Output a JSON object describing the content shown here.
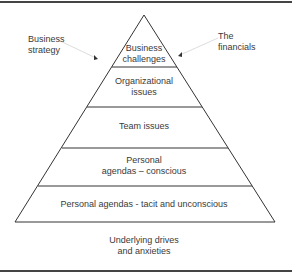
{
  "diagram": {
    "type": "pyramid",
    "levels": [
      {
        "line1": "Business",
        "line2": "challenges"
      },
      {
        "line1": "Organizational",
        "line2": "issues"
      },
      {
        "line1": "Team issues"
      },
      {
        "line1": "Personal",
        "line2": "agendas – conscious"
      },
      {
        "line1": "Personal agendas - tacit and unconscious"
      }
    ],
    "base_label": {
      "line1": "Underlying drives",
      "line2": "and anxieties"
    },
    "left_annotation": {
      "line1": "Business",
      "line2": "strategy"
    },
    "right_annotation": {
      "line1": "The",
      "line2": "financials"
    }
  }
}
